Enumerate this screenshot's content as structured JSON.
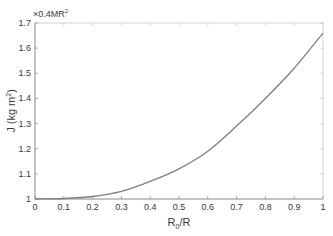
{
  "chart_data": {
    "type": "line",
    "title": "",
    "xlabel": "R0/R",
    "xlabel_main": "R",
    "xlabel_sub": "0",
    "xlabel_rest": "/R",
    "ylabel": "J (kg m2)",
    "ylabel_main": "J (kg m",
    "ylabel_sup": "2",
    "ylabel_close": ")",
    "y_multiplier": "×0.4MR",
    "y_multiplier_sup": "2",
    "xlim": [
      0,
      1
    ],
    "ylim": [
      1,
      1.7
    ],
    "xticks": [
      "0",
      "0.1",
      "0.2",
      "0.3",
      "0.4",
      "0.5",
      "0.6",
      "0.7",
      "0.8",
      "0.9",
      "1"
    ],
    "yticks": [
      "1",
      "1.1",
      "1.2",
      "1.3",
      "1.4",
      "1.5",
      "1.6",
      "1.7"
    ],
    "grid": false,
    "legend": null,
    "series": [
      {
        "name": "J",
        "color": "#7f7f7f",
        "x": [
          0,
          0.1,
          0.2,
          0.3,
          0.4,
          0.5,
          0.6,
          0.7,
          0.8,
          0.9,
          1.0
        ],
        "y": [
          1.0,
          1.002,
          1.01,
          1.03,
          1.07,
          1.12,
          1.19,
          1.29,
          1.4,
          1.52,
          1.66
        ]
      }
    ]
  }
}
